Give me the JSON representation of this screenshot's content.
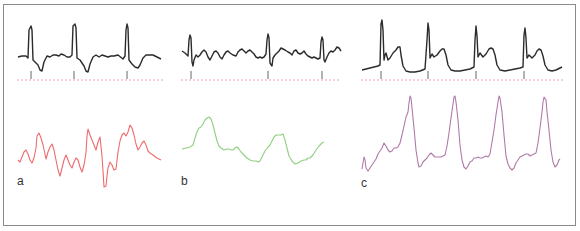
{
  "figure": {
    "colors": {
      "ecg": "#2b2b2b",
      "baseline": "#f0a0a8",
      "marker": "#555555",
      "frame": "#8a8a8a",
      "panel_a": "#ee6a6e",
      "panel_b": "#8fcf7f",
      "panel_c": "#b07aa8"
    },
    "panels": [
      {
        "id": "a",
        "label": "a",
        "label_pos": [
          17,
          175
        ],
        "ecg_markers_x": [
          31,
          74,
          127
        ],
        "baseline": {
          "x1": 17,
          "x2": 163,
          "y": 80
        },
        "ecg_points": "18,57 22,56 26,56 28,58 29,30 31,26 32,30 33,60 35,62 38,65 40,70 42,71 44,62 47,56 50,57 53,55 56,55 59,56 61,54 64,55 67,57 70,57 72,55 73,26 75,24 76,28 77,58 80,60 84,66 86,71 88,72 90,64 93,57 96,55 99,57 102,55 105,56 108,57 111,56 114,56 118,55 123,59 125,56 126,30 127,24 128,28 129,60 132,64 135,67 138,68 140,65 143,58 146,55 149,55 153,55 157,57 161,59",
        "wave_points": "18,160 20,162 22,157 24,152 26,150 28,154 30,160 32,163 34,158 36,148 37,136 39,133 41,138 43,145 45,154 46,159 48,152 50,147 52,144 54,150 56,160 58,170 60,176 62,168 64,160 66,155 68,160 70,165 72,168 74,162 76,158 78,160 80,167 82,172 84,165 86,153 87,136 88,129 90,135 92,140 94,145 96,150 98,142 100,137 102,156 103,171 104,187 106,186 107,176 108,168 110,162 112,165 114,170 116,169 118,152 120,141 122,135 124,133 126,136 128,132 130,125 132,128 134,135 136,144 138,150 140,147 142,143 144,141 146,145 148,151 150,153 153,155 157,158 161,160"
      },
      {
        "id": "b",
        "label": "b",
        "label_pos": [
          181,
          175
        ],
        "ecg_markers_x": [
          191,
          268,
          322
        ],
        "baseline": {
          "x1": 181,
          "x2": 341,
          "y": 80
        },
        "ecg_points": "182,51 185,53 188,56 189,40 190,35 191,38 192,62 193,66 194,60 196,55 198,57 200,55 202,52 204,50 206,52 208,57 210,60 212,56 214,52 216,51 218,53 220,57 222,59 224,55 226,52 228,51 230,53 233,55 236,56 238,52 240,50 242,49 244,51 246,53 248,51 250,50 252,52 254,54 256,57 258,58 260,57 262,58 264,57 266,54 267,40 268,34 269,38 270,63 272,66 273,58 275,55 277,53 279,51 281,48 283,49 285,50 288,52 290,53 292,55 294,51 296,50 298,53 300,54 302,53 304,51 306,54 308,56 310,57 312,58 314,57 316,58 318,59 320,58 321,42 322,37 323,40 324,60 325,62 327,57 329,53 331,51 333,52 335,50 337,47 339,48 341,51",
        "wave_points": "182,149 186,148 190,147 193,145 195,138 197,132 199,128 201,127 203,124 205,120 207,118 209,117 211,119 213,125 215,133 217,141 219,146 221,148 224,150 227,149 229,149 231,150 233,150 235,148 237,147 239,149 241,152 244,155 247,158 250,160 253,161 256,161 258,162 260,161 262,157 265,151 268,147 270,145 272,141 274,137 276,135 278,135 280,135 281,135 283,134 285,140 287,148 289,156 292,161 295,164 298,163 301,161 304,160 306,160 308,158 310,158 313,155 316,150 319,146 322,143 324,142"
      },
      {
        "id": "c",
        "label": "c",
        "label_pos": [
          361,
          177
        ],
        "ecg_markers_x": [
          381,
          428,
          476,
          524
        ],
        "baseline": {
          "x1": 361,
          "x2": 563,
          "y": 80
        },
        "ecg_points": "362,70 366,69 370,68 374,67 378,66 380,65 381,24 382,20 383,30 384,60 385,55 386,53 388,60 390,58 393,53 396,50 398,47 400,47 401,55 403,66 406,71 410,72 415,72 420,71 425,69 427,40 428,23 429,30 430,58 432,54 434,57 437,55 440,51 442,49 444,49 446,55 448,65 451,70 455,71 460,71 465,70 470,69 474,67 475,40 476,26 477,36 478,57 480,53 483,57 486,54 489,49 491,48 493,49 495,55 497,65 500,70 505,71 510,70 515,69 520,68 523,67 524,35 525,28 526,38 527,58 529,55 532,58 535,55 537,51 539,49 541,50 543,56 545,65 548,70 552,71 556,70 560,68 562,67",
        "wave_points": "362,169 363,163 364,157 365,160 366,168 368,171 370,168 372,165 374,162 376,159 378,154 380,151 382,148 384,143 386,146 388,150 390,152 392,151 394,148 396,148 398,147 400,143 402,135 404,126 406,117 408,112 409,103 410,96 411,98 412,108 414,128 416,150 418,163 419,167 421,166 423,162 425,160 427,158 429,155 431,153 433,155 435,157 437,157 439,157 441,157 443,156 445,155 447,146 449,133 451,118 453,104 454,97 455,96 456,102 458,120 460,145 462,160 464,167 466,169 468,166 470,162 472,161 474,158 476,158 478,157 480,158 482,158 484,157 486,156 488,157 490,154 492,142 494,130 496,115 498,102 499,96 500,98 502,112 504,135 506,156 508,164 510,168 512,170 514,168 516,163 518,160 520,157 522,156 524,155 526,154 528,154 530,156 532,155 534,154 536,153 538,143 540,128 542,112 543,102 544,97 546,100 547,112 549,130 551,150 553,162 555,167 557,165 559,160 560,159"
      }
    ]
  }
}
